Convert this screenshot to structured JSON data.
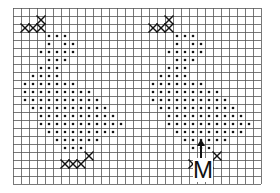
{
  "diagram": {
    "type": "stitch-chart",
    "grid": {
      "origin_x": 13,
      "origin_y": 8,
      "cell": 8,
      "cols": 31,
      "rows": 22,
      "line_color": "#555555",
      "bg": "#ffffff"
    },
    "symbols": {
      "dot": "•",
      "cross": "X"
    },
    "motifs": [
      {
        "name": "left-motif",
        "col_offset": 0,
        "pattern": [
          "...............",
          "...X...",
          ".XXX.",
          "....ooo",
          "....o.oo",
          "...ooooo",
          "....ooo",
          "...ooo",
          "..oooo",
          ".ooooooo",
          ".ooooooooo",
          ".oooooooooo",
          "..oooooooooo",
          "...oooooooooo",
          "...ooooooooooo",
          "....ooooooooo",
          ".....oooooo",
          "......ooo",
          ".........X",
          "......XXX"
        ]
      },
      {
        "name": "right-motif",
        "col_offset": 16,
        "pattern": "same"
      }
    ],
    "label": {
      "text": "M",
      "arrow": true,
      "x": 193,
      "y": 158,
      "size": 24,
      "arrow_x": 201,
      "arrow_top": 139,
      "arrow_bottom": 158
    }
  }
}
